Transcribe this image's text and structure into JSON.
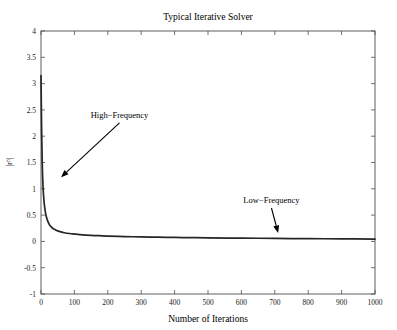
{
  "chart_data": {
    "type": "line",
    "title": "Typical Iterative Solver",
    "xlabel": "Number of Iterations",
    "ylabel": "|r^n|",
    "ylabel_base": "|r",
    "ylabel_sup": "n",
    "ylabel_tail": "|",
    "xlim": [
      0,
      1000
    ],
    "ylim": [
      -1,
      4
    ],
    "grid": false,
    "legend": null,
    "xticks": [
      0,
      100,
      200,
      300,
      400,
      500,
      600,
      700,
      800,
      900,
      1000
    ],
    "xticklabels": [
      "0",
      "100",
      "200",
      "300",
      "400",
      "500",
      "600",
      "700",
      "800",
      "900",
      "1000"
    ],
    "yticks": [
      -1,
      -0.5,
      0,
      0.5,
      1,
      1.5,
      2,
      2.5,
      3,
      3.5,
      4
    ],
    "yticklabels": [
      "-1",
      "-0.5",
      "0",
      "0.5",
      "1",
      "1.5",
      "2",
      "2.5",
      "3",
      "3.5",
      "4"
    ],
    "series": [
      {
        "name": "residual",
        "color": "#262626",
        "x": [
          0,
          2,
          4,
          6,
          8,
          10,
          13,
          16,
          20,
          25,
          30,
          35,
          40,
          50,
          60,
          70,
          85,
          100,
          125,
          150,
          175,
          200,
          250,
          300,
          350,
          400,
          450,
          500,
          600,
          700,
          800,
          900,
          1000
        ],
        "y": [
          3.15,
          2.05,
          1.42,
          1.06,
          0.84,
          0.7,
          0.56,
          0.47,
          0.39,
          0.32,
          0.28,
          0.25,
          0.23,
          0.2,
          0.18,
          0.165,
          0.15,
          0.14,
          0.125,
          0.115,
          0.108,
          0.102,
          0.092,
          0.085,
          0.08,
          0.075,
          0.071,
          0.068,
          0.062,
          0.057,
          0.052,
          0.048,
          0.045
        ]
      }
    ],
    "annotations": [
      {
        "id": "high-frequency",
        "text": "High−Frequency",
        "text_x": 235,
        "text_y": 2.35,
        "tip_x": 60,
        "tip_y": 1.22
      },
      {
        "id": "low-frequency",
        "text": "Low−Frequency",
        "text_x": 690,
        "text_y": 0.73,
        "tip_x": 710,
        "tip_y": 0.16
      }
    ]
  }
}
